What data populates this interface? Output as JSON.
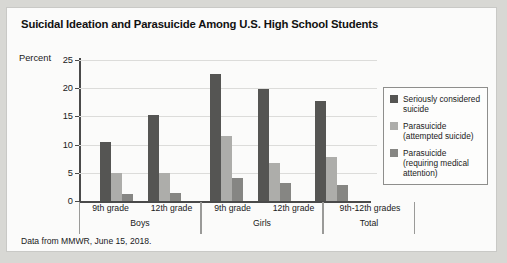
{
  "card": {
    "title": "Suicidal Ideation and Parasuicide Among U.S. High School Students",
    "source_note": "Data from MMWR, June 15, 2018."
  },
  "legend": {
    "items": [
      {
        "label": "Seriously considered suicide",
        "color": "#555553"
      },
      {
        "label": "Parasuicide (attempted suicide)",
        "color": "#adadaa"
      },
      {
        "label": "Parasuicide (requiring medical attention)",
        "color": "#868683"
      }
    ]
  },
  "chart_data": {
    "type": "bar",
    "title": "Suicidal Ideation and Parasuicide Among U.S. High School Students",
    "xlabel": "",
    "ylabel": "Percent",
    "ylim": [
      0,
      25
    ],
    "yticks": [
      0,
      5,
      10,
      15,
      20,
      25
    ],
    "grid": true,
    "legend_position": "right",
    "categories": [
      "9th grade",
      "12th grade",
      "9th grade",
      "12th grade",
      "9th-12th grades"
    ],
    "groups": [
      {
        "name": "Boys",
        "categories": [
          "9th grade",
          "12th grade"
        ]
      },
      {
        "name": "Girls",
        "categories": [
          "9th grade",
          "12th grade"
        ]
      },
      {
        "name": "Total",
        "categories": [
          "9th-12th grades"
        ]
      }
    ],
    "series": [
      {
        "name": "Seriously considered suicide",
        "color": "#555553",
        "values": [
          10.4,
          15.3,
          22.5,
          19.8,
          17.7
        ]
      },
      {
        "name": "Parasuicide (attempted suicide)",
        "color": "#adadaa",
        "values": [
          5.0,
          5.0,
          11.6,
          6.7,
          7.8
        ]
      },
      {
        "name": "Parasuicide (requiring medical attention)",
        "color": "#868683",
        "values": [
          1.3,
          1.5,
          4.1,
          3.2,
          2.9
        ]
      }
    ],
    "annotations": [
      "Data from MMWR, June 15, 2018."
    ]
  }
}
